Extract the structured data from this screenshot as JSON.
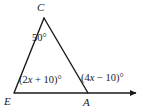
{
  "figure": {
    "type": "geometry-diagram",
    "background_color": "#ffffff",
    "stroke_color": "#1a1a1a",
    "vertices": [
      {
        "name": "C",
        "label": "C",
        "x": 44,
        "y": 18
      },
      {
        "name": "E",
        "label": "E",
        "x": 14,
        "y": 93
      },
      {
        "name": "A",
        "label": "A",
        "x": 88,
        "y": 93
      }
    ],
    "ray": {
      "from": "E",
      "through": "A",
      "end_x": 142,
      "y": 93,
      "arrowhead": true
    },
    "angles": {
      "apex": {
        "at": "C",
        "label": "50°",
        "value": 50,
        "unit": "degrees"
      },
      "left_base": {
        "at": "E",
        "label": "(2x + 10)°",
        "prefix": "(2",
        "variable": "x",
        "suffix": " + 10)°",
        "expression": "2x + 10"
      },
      "exterior_right": {
        "at": "A",
        "label": "(4x − 10)°",
        "prefix": "(4",
        "variable": "x",
        "suffix": " − 10)°",
        "expression": "4x - 10"
      }
    }
  }
}
